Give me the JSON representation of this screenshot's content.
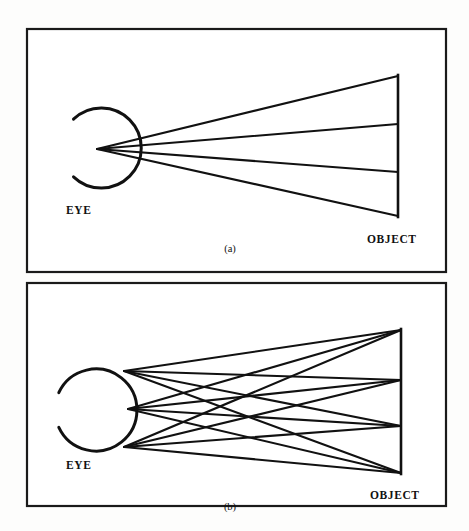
{
  "figure": {
    "background_color": "#fdfdfc",
    "ink_color": "#111111",
    "width": 469,
    "height": 531
  },
  "panels": [
    {
      "id": "panel-a",
      "caption": "(a)",
      "frame": {
        "x": 26,
        "y": 28,
        "width": 420,
        "height": 244
      },
      "eye": {
        "label": "EYE",
        "label_x": 92,
        "label_y": 211,
        "center_x": 108,
        "center_y": 148,
        "radius": 40,
        "gap_description": "open arc facing left",
        "arc_start_deg": 152,
        "arc_end_deg": 208
      },
      "object": {
        "label": "OBJECT",
        "label_x": 397,
        "label_y": 240,
        "x": 398,
        "top_y": 76,
        "bottom_y": 216,
        "node_ys": [
          76,
          124,
          172,
          216
        ]
      },
      "rays": {
        "description": "four straight rays emanating from a single point in the eye to four nodes on the object",
        "origin": {
          "x": 97,
          "y": 149
        },
        "count": 4
      }
    },
    {
      "id": "panel-b",
      "caption": "(b)",
      "frame": {
        "x": 26,
        "y": 282,
        "width": 420,
        "height": 225
      },
      "eye": {
        "label": "EYE",
        "label_x": 92,
        "label_y": 466,
        "center_x": 96,
        "center_y": 410,
        "radius": 41,
        "gap_description": "open arc facing left",
        "arc_start_deg": 155,
        "arc_end_deg": 205
      },
      "object": {
        "label": "OBJECT",
        "label_x": 399,
        "label_y": 497,
        "x": 401,
        "top_y": 330,
        "bottom_y": 473,
        "node_ys": [
          330,
          380,
          426,
          473
        ]
      },
      "rays": {
        "description": "rays from every object node to every one of three eye-surface points, producing a crossing mesh",
        "eye_points": [
          {
            "x": 124,
            "y": 371
          },
          {
            "x": 128,
            "y": 409
          },
          {
            "x": 124,
            "y": 447
          }
        ],
        "count": 12
      }
    }
  ]
}
